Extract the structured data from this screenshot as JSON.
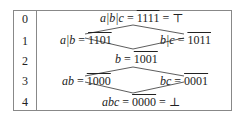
{
  "rows": [
    {
      "index": "0"
    },
    {
      "index": "1"
    },
    {
      "index": "2"
    },
    {
      "index": "3"
    },
    {
      "index": "4"
    }
  ],
  "nodes": {
    "top": {
      "expr": "a|b|c",
      "eq": " = ",
      "value": "1111",
      "suffix": " = ⊤"
    },
    "ab_or": {
      "expr": "a|b",
      "eq": " = ",
      "value": "1101"
    },
    "bc_or": {
      "expr": "b|c",
      "eq": " = ",
      "value": "1011"
    },
    "b": {
      "expr": "b",
      "eq": " = ",
      "value": "1001"
    },
    "ab": {
      "expr": "ab",
      "eq": " = ",
      "value": "1000"
    },
    "bc": {
      "expr": "bc",
      "eq": " = ",
      "value": "0001"
    },
    "bottom": {
      "expr": "abc",
      "eq": " = ",
      "value": "0000",
      "suffix": " = ⊥"
    }
  },
  "edges": [
    [
      "top",
      "ab_or"
    ],
    [
      "top",
      "bc_or"
    ],
    [
      "ab_or",
      "b"
    ],
    [
      "bc_or",
      "b"
    ],
    [
      "b",
      "ab"
    ],
    [
      "b",
      "bc"
    ],
    [
      "ab",
      "bottom"
    ],
    [
      "bc",
      "bottom"
    ]
  ]
}
